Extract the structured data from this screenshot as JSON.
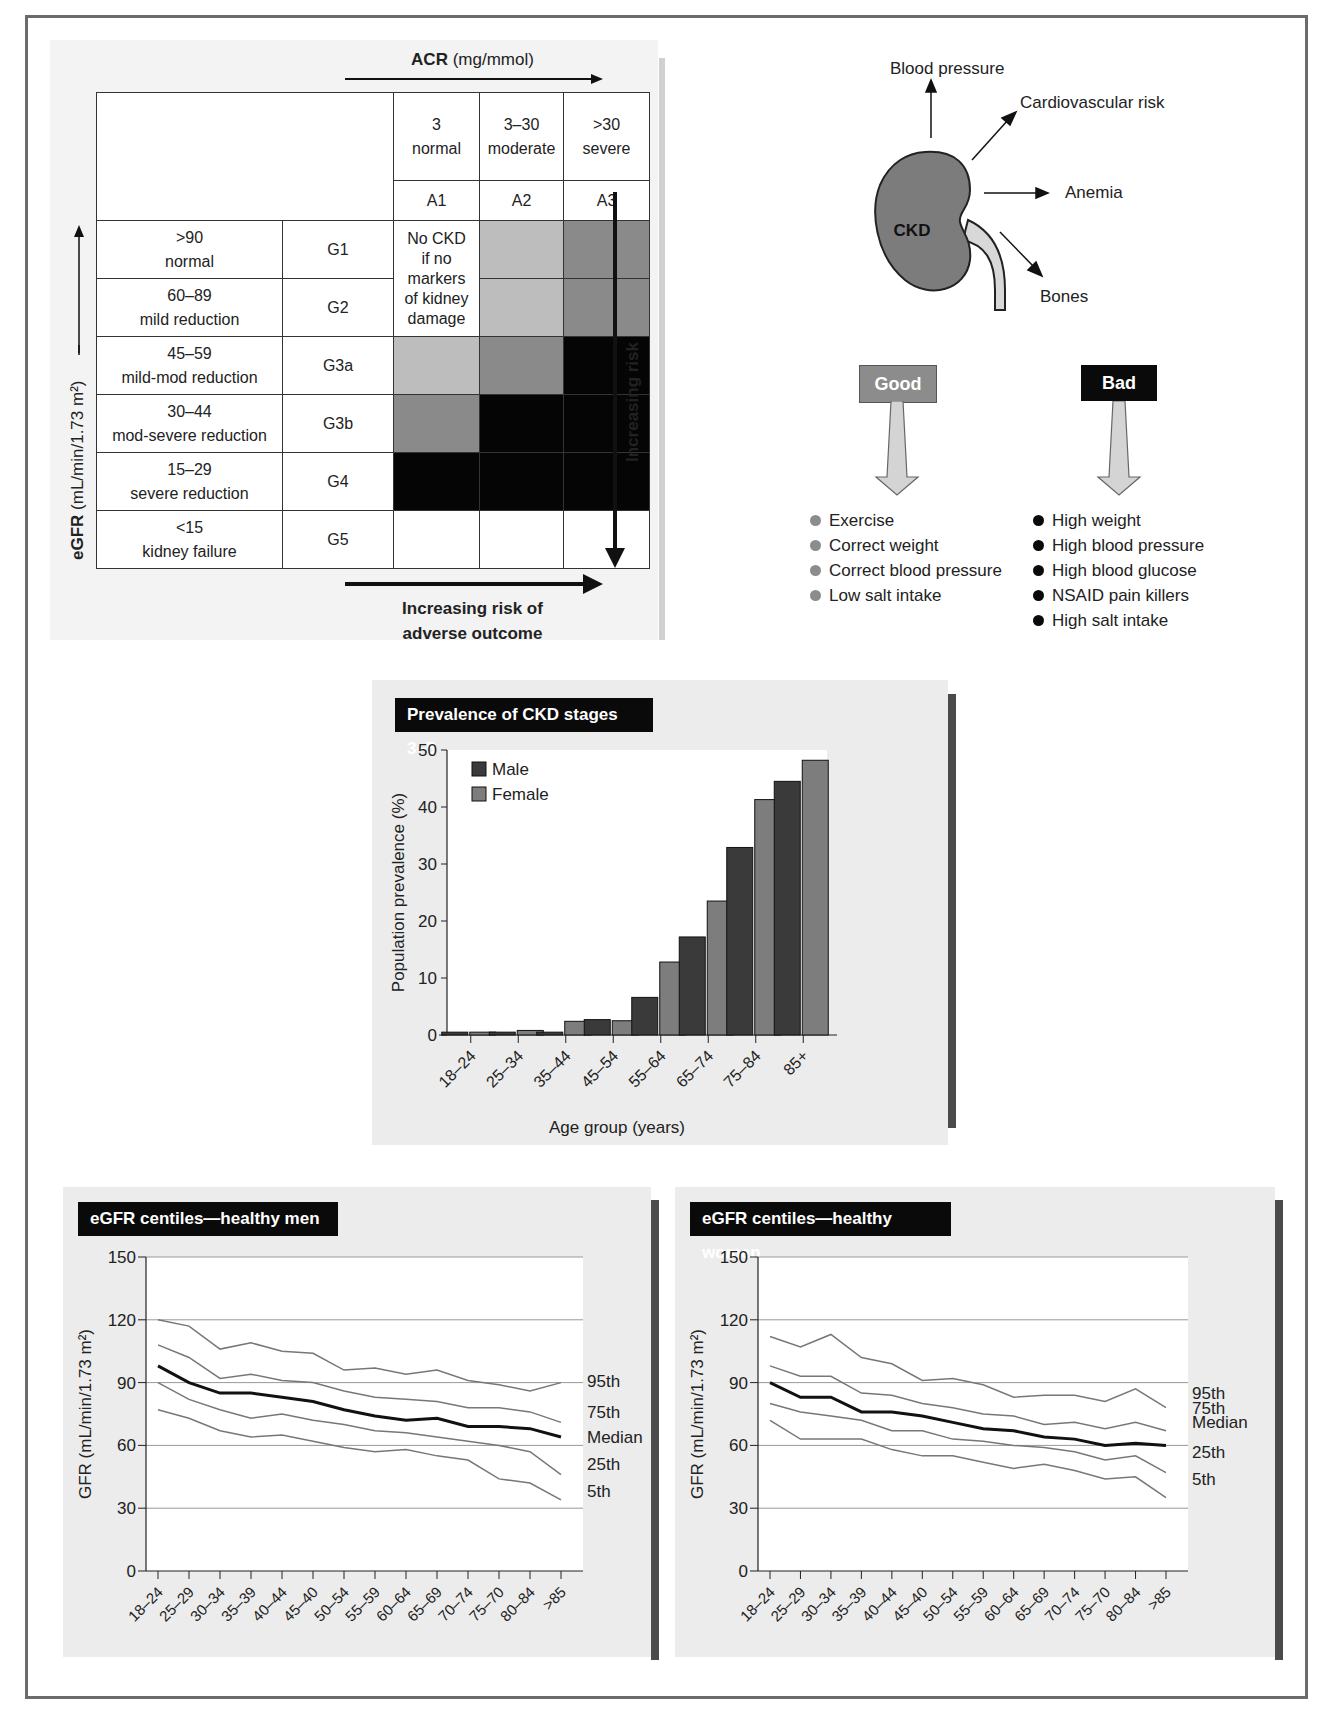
{
  "staging_table": {
    "acr_title_bold": "ACR",
    "acr_title_unit": " (mg/mmol)",
    "albuminuria_columns": [
      {
        "range": "3",
        "label": "normal",
        "code": "A1"
      },
      {
        "range": "3–30",
        "label": "moderate",
        "code": "A2"
      },
      {
        "range": ">30",
        "label": "severe",
        "code": "A3"
      }
    ],
    "gfr_rows": [
      {
        "range": ">90",
        "label": "normal",
        "code": "G1"
      },
      {
        "range": "60–89",
        "label": "mild reduction",
        "code": "G2"
      },
      {
        "range": "45–59",
        "label": "mild-mod reduction",
        "code": "G3a"
      },
      {
        "range": "30–44",
        "label": "mod-severe reduction",
        "code": "G3b"
      },
      {
        "range": "15–29",
        "label": "severe reduction",
        "code": "G4"
      },
      {
        "range": "<15",
        "label": "kidney failure",
        "code": "G5"
      }
    ],
    "no_ckd_note": "No CKD if no markers of kidney damage",
    "no_ckd_lines": [
      "No CKD",
      "if no",
      "markers",
      "of kidney",
      "damage"
    ],
    "risk_grid": [
      [
        "note",
        "light",
        "medium"
      ],
      [
        "note",
        "light",
        "medium"
      ],
      [
        "light",
        "medium",
        "dark"
      ],
      [
        "medium",
        "dark",
        "dark"
      ],
      [
        "dark",
        "dark",
        "dark"
      ],
      [
        "white",
        "white",
        "white"
      ]
    ],
    "egfr_axis_bold": "eGFR",
    "egfr_axis_unit": " (mL/min/1.73 m²)",
    "vertical_risk_label": "Increasing risk",
    "horizontal_risk_label_1": "Increasing risk of",
    "horizontal_risk_label_2": "adverse outcome",
    "colors": {
      "light": "#bdbdbd",
      "medium": "#8a8a8a",
      "dark": "#050505"
    }
  },
  "kidney_diagram": {
    "center_label": "CKD",
    "effects": [
      "Blood pressure",
      "Cardiovascular risk",
      "Anemia",
      "Bones"
    ]
  },
  "factors": {
    "good": {
      "label": "Good",
      "color": "#8c8c8c",
      "items": [
        "Exercise",
        "Correct weight",
        "Correct blood pressure",
        "Low salt intake"
      ]
    },
    "bad": {
      "label": "Bad",
      "color": "#0a0a0a",
      "items": [
        "High weight",
        "High blood pressure",
        "High blood glucose",
        "NSAID pain killers",
        "High salt intake"
      ]
    }
  },
  "prevalence_panel": {
    "title": "Prevalence of CKD stages 3–5"
  },
  "men_panel": {
    "title": "eGFR centiles—healthy men"
  },
  "women_panel": {
    "title": "eGFR centiles—healthy women"
  },
  "chart_data": [
    {
      "type": "bar",
      "title": "Prevalence of CKD stages 3–5",
      "xlabel": "Age group (years)",
      "ylabel": "Population prevalence (%)",
      "ylim": [
        0,
        50
      ],
      "yticks": [
        0,
        10,
        20,
        30,
        40,
        50
      ],
      "categories": [
        "18–24",
        "25–34",
        "35–44",
        "45–54",
        "55–64",
        "65–74",
        "75–84",
        "85+"
      ],
      "series": [
        {
          "name": "Male",
          "color": "#3a3a3a",
          "values": [
            0.5,
            0.5,
            0.5,
            2.7,
            6.6,
            17.2,
            32.9,
            44.5
          ]
        },
        {
          "name": "Female",
          "color": "#7d7d7d",
          "values": [
            0.5,
            0.8,
            2.4,
            2.5,
            12.8,
            23.5,
            41.3,
            48.2
          ]
        }
      ],
      "legend_position": "upper-left",
      "grid": false
    },
    {
      "type": "line",
      "title": "eGFR centiles—healthy men",
      "xlabel": "Age group (years)",
      "ylabel": "GFR (mL/min/1.73 m²)",
      "ylim": [
        0,
        150
      ],
      "yticks": [
        0,
        30,
        60,
        90,
        120,
        150
      ],
      "grid": true,
      "categories": [
        "18–24",
        "25–29",
        "30–34",
        "35–39",
        "40–44",
        "45–40",
        "50–54",
        "55–59",
        "60–64",
        "65–69",
        "70–74",
        "75–70",
        "80–84",
        ">85"
      ],
      "series": [
        {
          "name": "95th",
          "values": [
            120,
            117,
            106,
            109,
            105,
            104,
            96,
            97,
            94,
            96,
            91,
            89,
            86,
            90
          ]
        },
        {
          "name": "75th",
          "values": [
            108,
            102,
            92,
            94,
            91,
            90,
            86,
            83,
            82,
            81,
            78,
            78,
            76,
            71
          ]
        },
        {
          "name": "Median",
          "values": [
            98,
            90,
            85,
            85,
            83,
            81,
            77,
            74,
            72,
            73,
            69,
            69,
            68,
            64
          ]
        },
        {
          "name": "25th",
          "values": [
            90,
            82,
            77,
            73,
            75,
            72,
            70,
            67,
            66,
            64,
            62,
            60,
            57,
            46
          ]
        },
        {
          "name": "5th",
          "values": [
            77,
            73,
            67,
            64,
            65,
            62,
            59,
            57,
            58,
            55,
            53,
            44,
            42,
            34
          ]
        }
      ]
    },
    {
      "type": "line",
      "title": "eGFR centiles—healthy women",
      "xlabel": "Age group (years)",
      "ylabel": "GFR (mL/min/1.73 m²)",
      "ylim": [
        0,
        150
      ],
      "yticks": [
        0,
        30,
        60,
        90,
        120,
        150
      ],
      "grid": true,
      "categories": [
        "18–24",
        "25–29",
        "30–34",
        "35–39",
        "40–44",
        "45–40",
        "50–54",
        "55–59",
        "60–64",
        "65–69",
        "70–74",
        "75–70",
        "80–84",
        ">85"
      ],
      "series": [
        {
          "name": "95th",
          "values": [
            112,
            107,
            113,
            102,
            99,
            91,
            92,
            89,
            83,
            84,
            84,
            81,
            87,
            78
          ]
        },
        {
          "name": "75th",
          "values": [
            98,
            93,
            93,
            85,
            84,
            80,
            78,
            75,
            74,
            70,
            71,
            68,
            71,
            67
          ]
        },
        {
          "name": "Median",
          "values": [
            90,
            83,
            83,
            76,
            76,
            74,
            71,
            68,
            67,
            64,
            63,
            60,
            61,
            60
          ]
        },
        {
          "name": "25th",
          "values": [
            80,
            76,
            74,
            72,
            67,
            67,
            63,
            62,
            60,
            59,
            57,
            53,
            55,
            47
          ]
        },
        {
          "name": "5th",
          "values": [
            72,
            63,
            63,
            63,
            58,
            55,
            55,
            52,
            49,
            51,
            48,
            44,
            45,
            35
          ]
        }
      ]
    }
  ]
}
